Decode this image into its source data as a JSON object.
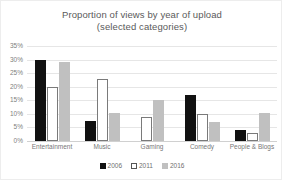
{
  "chart_data": {
    "type": "bar",
    "title": "Proportion of views by year of upload",
    "subtitle": "(selected categories)",
    "xlabel": "",
    "ylabel": "",
    "ylim": [
      0,
      35
    ],
    "ytick_labels": [
      "35%",
      "30%",
      "25%",
      "20%",
      "15%",
      "10%",
      "5%",
      "0%"
    ],
    "ytick_values": [
      35,
      30,
      25,
      20,
      15,
      10,
      5,
      0
    ],
    "grid": true,
    "legend_position": "bottom",
    "categories": [
      "Entertainment",
      "Music",
      "Gaming",
      "Comedy",
      "People & Blogs"
    ],
    "series": [
      {
        "name": "2006",
        "color": "#111111",
        "values": [
          30,
          7.5,
          0,
          17,
          4
        ]
      },
      {
        "name": "2011",
        "color": "#ffffff",
        "values": [
          20,
          23,
          9,
          10,
          3
        ]
      },
      {
        "name": "2016",
        "color": "#c0c0c0",
        "values": [
          29,
          10.5,
          15,
          7,
          10.5
        ]
      }
    ]
  }
}
